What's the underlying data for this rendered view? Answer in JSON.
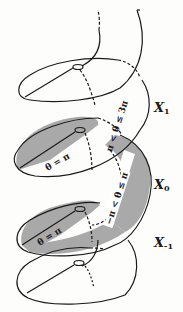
{
  "diagram": {
    "type": "helicoidal-covering-surface",
    "colors": {
      "background": "#fdfdfb",
      "stroke": "#1a1a1a",
      "shaded_sheet": "#a9a9a9",
      "highlight_band": "#ffffff"
    },
    "sheets": [
      {
        "id": "X1",
        "base": "X",
        "sub": "1",
        "range_label": "π < θ ≤ 3π",
        "shaded": false
      },
      {
        "id": "X0",
        "base": "X",
        "sub": "0",
        "range_label": "−π < θ ≤ π",
        "shaded": true
      },
      {
        "id": "X-1",
        "base": "X",
        "sub": "-1",
        "range_label": "",
        "shaded": false
      }
    ],
    "cut_labels": [
      {
        "text": "θ = π",
        "position": "upper-cut"
      },
      {
        "text": "θ = π",
        "position": "lower-cut"
      }
    ]
  }
}
